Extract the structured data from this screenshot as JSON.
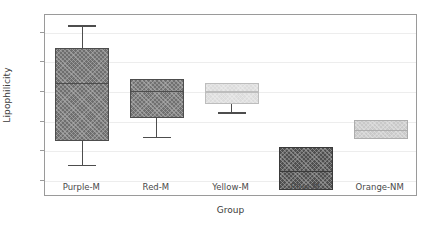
{
  "chart_data": {
    "type": "box",
    "title": "",
    "xlabel": "Group",
    "ylabel": "Lipophilicity",
    "categories": [
      "Purple-M",
      "Red-M",
      "Yellow-M",
      "Blue-M",
      "Orange-NM"
    ],
    "ylim": [
      -1.55,
      4.6
    ],
    "yticks": [
      -1,
      0,
      1,
      2,
      3,
      4
    ],
    "ytick_labels": [
      "−1",
      "0",
      "1",
      "2",
      "3",
      "4"
    ],
    "grid": "horizontal",
    "legend": "none",
    "boxes": [
      {
        "category": "Purple-M",
        "whisker_low": -0.47,
        "q1": 0.35,
        "median": 2.3,
        "q3": 3.5,
        "whisker_high": 4.25,
        "color": "#6e6e6e",
        "edge_color": "#4d4d4d"
      },
      {
        "category": "Red-M",
        "whisker_low": 0.48,
        "q1": 1.12,
        "median": 2.05,
        "q3": 2.43,
        "whisker_high": 2.43,
        "color": "#707070",
        "edge_color": "#4d4d4d"
      },
      {
        "category": "Yellow-M",
        "whisker_low": 1.31,
        "q1": 1.6,
        "median": 2.02,
        "q3": 2.32,
        "whisker_high": 2.32,
        "color": "#dcdcdc",
        "edge_color": "#bdbdbd"
      },
      {
        "category": "Blue-M",
        "whisker_low": -1.3,
        "q1": -1.3,
        "median": -0.67,
        "q3": 0.13,
        "whisker_high": 0.13,
        "color": "#4f4f4f",
        "edge_color": "#3a3a3a"
      },
      {
        "category": "Orange-NM",
        "whisker_low": 0.4,
        "q1": 0.4,
        "median": 0.72,
        "q3": 1.06,
        "whisker_high": 1.06,
        "color": "#c9c9c9",
        "edge_color": "#adadad"
      }
    ]
  },
  "axes": {
    "ylabel": "Lipophilicity",
    "xlabel": "Group"
  }
}
